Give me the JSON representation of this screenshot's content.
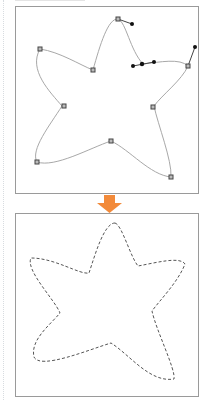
{
  "diagram": {
    "top_panel": {
      "label": "",
      "stroke_color": "#a0a0a0",
      "anchor_color": "#555555",
      "handle_color": "#111111"
    },
    "arrow": {
      "color": "#f28a3a",
      "direction": "down"
    },
    "bottom_panel": {
      "label": "",
      "stroke_color": "#555555",
      "stroke_style": "dashed"
    }
  }
}
